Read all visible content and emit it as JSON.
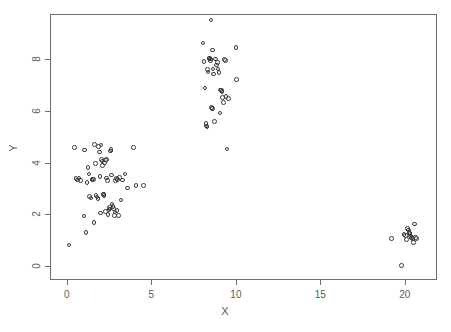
{
  "chart_data": {
    "type": "scatter",
    "title": "",
    "xlabel": "X",
    "ylabel": "Y",
    "xlim": [
      -1.0,
      21.9
    ],
    "ylim": [
      -0.55,
      9.75
    ],
    "xticks": [
      0,
      5,
      10,
      15,
      20
    ],
    "xtick_labels": [
      "0",
      "5",
      "10",
      "15",
      "20"
    ],
    "yticks": [
      0,
      2,
      4,
      6,
      8
    ],
    "ytick_labels": [
      "0",
      "2",
      "4",
      "6",
      "8"
    ],
    "grid": false,
    "legend": null,
    "marker": "open-circle",
    "marker_color": "#3b3b3b",
    "frame_color": "#6e6e6e",
    "background": "#ffffff",
    "n_points": 120,
    "clusters": [
      {
        "name": "cluster-left",
        "approx_center": [
          2.2,
          3.0
        ],
        "count": 63
      },
      {
        "name": "cluster-middle",
        "approx_center": [
          8.8,
          7.1
        ],
        "count": 40
      },
      {
        "name": "cluster-right",
        "approx_center": [
          20.1,
          1.1
        ],
        "count": 17
      }
    ],
    "points": [
      [
        0.12,
        0.8
      ],
      [
        0.45,
        4.57
      ],
      [
        0.55,
        3.38
      ],
      [
        0.62,
        3.33
      ],
      [
        0.72,
        3.4
      ],
      [
        0.8,
        3.3
      ],
      [
        1.0,
        1.93
      ],
      [
        1.05,
        4.48
      ],
      [
        1.12,
        1.3
      ],
      [
        1.18,
        3.22
      ],
      [
        1.25,
        3.8
      ],
      [
        1.3,
        3.55
      ],
      [
        1.35,
        2.68
      ],
      [
        1.42,
        2.62
      ],
      [
        1.48,
        3.33
      ],
      [
        1.52,
        3.36
      ],
      [
        1.56,
        3.35
      ],
      [
        1.6,
        1.68
      ],
      [
        1.62,
        4.7
      ],
      [
        1.7,
        3.95
      ],
      [
        1.72,
        2.72
      ],
      [
        1.78,
        2.66
      ],
      [
        1.84,
        2.6
      ],
      [
        1.88,
        4.63
      ],
      [
        1.92,
        4.4
      ],
      [
        1.95,
        3.45
      ],
      [
        1.98,
        2.05
      ],
      [
        2.02,
        4.68
      ],
      [
        2.05,
        4.12
      ],
      [
        2.08,
        4.05
      ],
      [
        2.12,
        3.88
      ],
      [
        2.15,
        2.78
      ],
      [
        2.18,
        2.75
      ],
      [
        2.2,
        2.72
      ],
      [
        2.24,
        3.98
      ],
      [
        2.28,
        4.1
      ],
      [
        2.3,
        2.1
      ],
      [
        2.33,
        4.12
      ],
      [
        2.36,
        3.4
      ],
      [
        2.4,
        3.3
      ],
      [
        2.44,
        1.98
      ],
      [
        2.48,
        2.18
      ],
      [
        2.52,
        2.25
      ],
      [
        2.55,
        2.2
      ],
      [
        2.58,
        4.45
      ],
      [
        2.6,
        4.5
      ],
      [
        2.64,
        3.52
      ],
      [
        2.68,
        2.4
      ],
      [
        2.72,
        2.3
      ],
      [
        2.75,
        2.22
      ],
      [
        2.8,
        1.95
      ],
      [
        2.84,
        2.08
      ],
      [
        2.88,
        3.3
      ],
      [
        2.92,
        3.38
      ],
      [
        2.96,
        2.15
      ],
      [
        3.0,
        3.35
      ],
      [
        3.05,
        1.95
      ],
      [
        3.1,
        3.42
      ],
      [
        3.2,
        2.55
      ],
      [
        3.3,
        3.32
      ],
      [
        3.45,
        3.55
      ],
      [
        3.6,
        3.02
      ],
      [
        3.95,
        4.58
      ],
      [
        4.08,
        3.12
      ],
      [
        4.55,
        3.12
      ],
      [
        8.05,
        8.62
      ],
      [
        8.12,
        7.92
      ],
      [
        8.18,
        6.88
      ],
      [
        8.22,
        5.5
      ],
      [
        8.25,
        5.42
      ],
      [
        8.28,
        5.38
      ],
      [
        8.32,
        7.6
      ],
      [
        8.36,
        7.5
      ],
      [
        8.4,
        8.02
      ],
      [
        8.44,
        8.05
      ],
      [
        8.48,
        8.0
      ],
      [
        8.5,
        7.95
      ],
      [
        8.52,
        9.52
      ],
      [
        8.55,
        6.12
      ],
      [
        8.58,
        6.1
      ],
      [
        8.6,
        6.08
      ],
      [
        8.62,
        8.35
      ],
      [
        8.65,
        7.62
      ],
      [
        8.68,
        7.42
      ],
      [
        8.72,
        5.58
      ],
      [
        8.78,
        8.0
      ],
      [
        8.85,
        7.78
      ],
      [
        8.9,
        7.88
      ],
      [
        8.95,
        7.62
      ],
      [
        9.0,
        7.48
      ],
      [
        9.05,
        5.92
      ],
      [
        9.1,
        6.8
      ],
      [
        9.14,
        6.78
      ],
      [
        9.18,
        6.76
      ],
      [
        9.22,
        6.52
      ],
      [
        9.28,
        6.32
      ],
      [
        9.32,
        7.98
      ],
      [
        9.38,
        7.95
      ],
      [
        9.42,
        6.55
      ],
      [
        9.48,
        4.52
      ],
      [
        9.55,
        6.48
      ],
      [
        10.0,
        8.45
      ],
      [
        10.05,
        7.22
      ],
      [
        19.2,
        1.05
      ],
      [
        19.8,
        0.02
      ],
      [
        19.95,
        1.22
      ],
      [
        20.02,
        1.18
      ],
      [
        20.08,
        1.02
      ],
      [
        20.15,
        1.45
      ],
      [
        20.2,
        1.38
      ],
      [
        20.25,
        1.3
      ],
      [
        20.3,
        1.25
      ],
      [
        20.34,
        1.15
      ],
      [
        20.38,
        1.08
      ],
      [
        20.42,
        1.12
      ],
      [
        20.46,
        1.05
      ],
      [
        20.5,
        0.9
      ],
      [
        20.58,
        1.62
      ],
      [
        20.62,
        1.1
      ],
      [
        20.68,
        1.05
      ]
    ]
  }
}
